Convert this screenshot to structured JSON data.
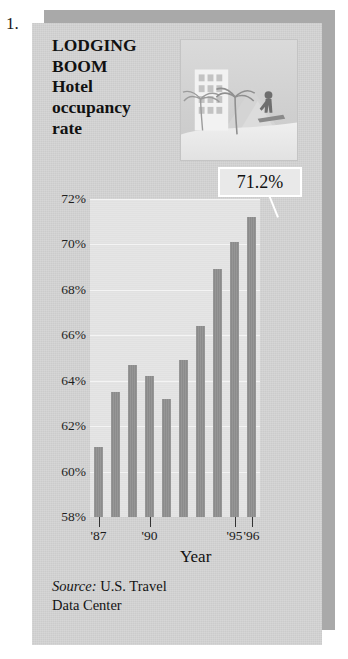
{
  "figure_number": "1.",
  "title": {
    "lines": [
      "LODGING",
      "BOOM",
      "Hotel",
      "occupancy",
      "rate"
    ]
  },
  "illustration": {
    "name": "resort-scene-illustration",
    "elements": [
      "hotel-building",
      "palm-tree",
      "palm-tree",
      "mountain",
      "person-figure",
      "beach"
    ]
  },
  "callout": {
    "value": "71.2%"
  },
  "axis_title": "Year",
  "source": {
    "label": "Source:",
    "text": " U.S. Travel",
    "line2": "Data Center"
  },
  "colors": {
    "card_background": "#cfcfcf",
    "plot_background": "#e3e3e3",
    "bar": "#8e8e8e",
    "shadow": "#a9a9a9",
    "gridline": "#f4f4f4",
    "callout_background": "#e9e9e9"
  },
  "chart_data": {
    "type": "bar",
    "title": "LODGING BOOM Hotel occupancy rate",
    "xlabel": "Year",
    "ylabel": "",
    "ylim": [
      58,
      72
    ],
    "ytick_labels": [
      "72%",
      "70%",
      "68%",
      "66%",
      "64%",
      "62%",
      "60%",
      "58%"
    ],
    "yticks": [
      72,
      70,
      68,
      66,
      64,
      62,
      60,
      58
    ],
    "grid": true,
    "legend": "none",
    "categories": [
      "1987",
      "1988",
      "1989",
      "1990",
      "1991",
      "1992",
      "1993",
      "1994",
      "1995",
      "1996"
    ],
    "xtick_labels": [
      "'87",
      "'90",
      "'95",
      "'96"
    ],
    "xtick_indices": [
      0,
      3,
      8,
      9
    ],
    "values": [
      61.1,
      63.5,
      64.7,
      64.2,
      63.2,
      64.9,
      66.4,
      68.9,
      70.1,
      71.2
    ],
    "annotations": [
      {
        "text": "71.2%",
        "target_index": 9,
        "value": 71.2
      }
    ],
    "source": "Source: U.S. Travel Data Center"
  }
}
